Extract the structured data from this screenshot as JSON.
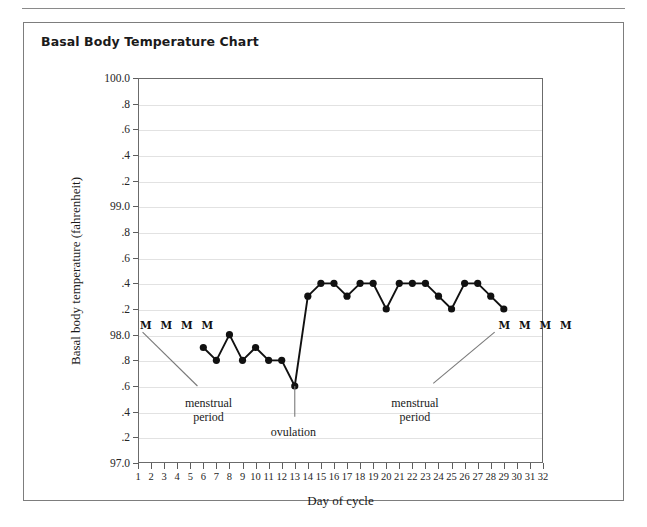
{
  "page": {
    "folio": ""
  },
  "figure": {
    "title": "Basal Body Temperature Chart"
  },
  "chart_data": {
    "type": "line",
    "title": "Basal Body Temperature Chart",
    "xlabel": "Day of cycle",
    "ylabel": "Basal body temperature (fahrenheit)",
    "xlim": [
      1,
      32
    ],
    "ylim": [
      97.0,
      100.0
    ],
    "grid": true,
    "legend_position": "none",
    "y_tick_values": [
      97.0,
      97.2,
      97.4,
      97.6,
      97.8,
      98.0,
      98.2,
      98.4,
      98.6,
      98.8,
      99.0,
      99.2,
      99.4,
      99.6,
      99.8,
      100.0
    ],
    "y_tick_labels": [
      "97.0",
      ".2",
      ".4",
      ".6",
      ".8",
      "98.0",
      ".2",
      ".4",
      ".6",
      ".8",
      "99.0",
      ".2",
      ".4",
      ".6",
      ".8",
      "100.0"
    ],
    "x_tick_values": [
      1,
      2,
      3,
      4,
      5,
      6,
      7,
      8,
      9,
      10,
      11,
      12,
      13,
      14,
      15,
      16,
      17,
      18,
      19,
      20,
      21,
      22,
      23,
      24,
      25,
      26,
      27,
      28,
      29,
      30,
      31,
      32
    ],
    "x_tick_labels": [
      "1",
      "2",
      "3",
      "4",
      "5",
      "6",
      "7",
      "8",
      "9",
      "10",
      "11",
      "12",
      "13",
      "14",
      "15",
      "16",
      "17",
      "18",
      "19",
      "20",
      "21",
      "22",
      "23",
      "24",
      "25",
      "26",
      "27",
      "28",
      "29",
      "30",
      "31",
      "32"
    ],
    "series": [
      {
        "name": "Basal body temperature",
        "color": "#111111",
        "x": [
          6,
          7,
          8,
          9,
          10,
          11,
          12,
          13,
          14,
          15,
          16,
          17,
          18,
          19,
          20,
          21,
          22,
          23,
          24,
          25,
          26,
          27,
          28,
          29
        ],
        "values": [
          97.9,
          97.8,
          98.0,
          97.8,
          97.9,
          97.8,
          97.8,
          97.6,
          98.3,
          98.4,
          98.4,
          98.3,
          98.4,
          98.4,
          98.2,
          98.4,
          98.4,
          98.4,
          98.3,
          98.2,
          98.4,
          98.4,
          98.3,
          98.2
        ]
      }
    ],
    "annotations": [
      {
        "id": "menstrual-period-start",
        "text": "menstrual\nperiod",
        "line1": "menstrual",
        "line2": "period",
        "marker_text": "M M M M",
        "marker_days": [
          1,
          2,
          3,
          4
        ]
      },
      {
        "id": "ovulation",
        "text": "ovulation",
        "line1": "ovulation",
        "line2": "",
        "marker_text": "",
        "marker_days": [
          13
        ]
      },
      {
        "id": "menstrual-period-next",
        "text": "menstrual\nperiod",
        "line1": "menstrual",
        "line2": "period",
        "marker_text": "M M M M",
        "marker_days": [
          29,
          30,
          31,
          32
        ]
      }
    ]
  },
  "colors": {
    "series": "#111111",
    "grid": "#e2e2e2",
    "axis": "#6b6b6b",
    "frame": "#7d7d7d",
    "text": "#1a1a1a",
    "leader": "#7a7a7a"
  }
}
